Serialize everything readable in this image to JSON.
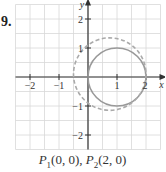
{
  "problem": {
    "number": "9."
  },
  "caption": {
    "p1_label": "P",
    "p1_sub": "1",
    "p1_coords": "(0, 0),",
    "p2_label": "P",
    "p2_sub": "2",
    "p2_coords": "(2, 0)"
  },
  "colors": {
    "grid": "#d8d8d8",
    "axis": "#333333",
    "solid_circle": "#999999",
    "dashed_circle": "#aaaaaa"
  },
  "chart_data": {
    "type": "line",
    "title": "",
    "xlabel": "x",
    "ylabel": "y",
    "xlim": [
      -2.5,
      2.5
    ],
    "ylim": [
      -2.5,
      2.5
    ],
    "grid": true,
    "grid_step": 0.5,
    "x_ticks": [
      -2,
      -1,
      1,
      2
    ],
    "y_ticks": [
      -2,
      -1,
      1,
      2
    ],
    "x_tick_labels": [
      "−2",
      "−1",
      "1",
      "2"
    ],
    "y_tick_labels": [
      "−2",
      "−1",
      "1",
      "2"
    ],
    "series": [
      {
        "name": "solid circle",
        "style": "solid",
        "shape": "circle",
        "center": [
          1,
          0
        ],
        "radius": 1
      },
      {
        "name": "dashed circle",
        "style": "dashed",
        "shape": "circle",
        "center": [
          0.75,
          0.1
        ],
        "radius": 1.25
      }
    ],
    "points": [
      {
        "name": "P1",
        "x": 0,
        "y": 0
      },
      {
        "name": "P2",
        "x": 2,
        "y": 0
      }
    ]
  }
}
